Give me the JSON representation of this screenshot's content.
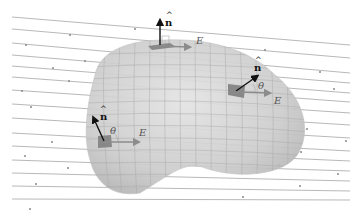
{
  "diagram": {
    "colors": {
      "field_line": "#9a9a9a",
      "surface_fill": "#cfcfcf",
      "surface_grid": "#a8a8a8",
      "patch": "#888888",
      "normal_vector": "#111111",
      "field_vector": "#8c8c8c"
    },
    "labels": {
      "top": {
        "normal": "n",
        "hat": "^",
        "field": "E"
      },
      "right": {
        "normal": "n",
        "hat": "^",
        "angle": "θ",
        "field": "E"
      },
      "left": {
        "normal": "n",
        "hat": "^",
        "angle": "θ",
        "field": "E"
      }
    },
    "field_lines": [
      {
        "y1": 17,
        "y2": 45
      },
      {
        "y1": 29,
        "y2": 58
      },
      {
        "y1": 43,
        "y2": 73
      },
      {
        "y1": 55,
        "y2": 83
      },
      {
        "y1": 66,
        "y2": 93
      },
      {
        "y1": 77,
        "y2": 102
      },
      {
        "y1": 90,
        "y2": 113
      },
      {
        "y1": 104,
        "y2": 125
      },
      {
        "y1": 118,
        "y2": 138
      },
      {
        "y1": 133,
        "y2": 151
      },
      {
        "y1": 146,
        "y2": 161
      },
      {
        "y1": 160,
        "y2": 171
      },
      {
        "y1": 173,
        "y2": 181
      },
      {
        "y1": 186,
        "y2": 191
      },
      {
        "y1": 199,
        "y2": 200
      }
    ]
  }
}
